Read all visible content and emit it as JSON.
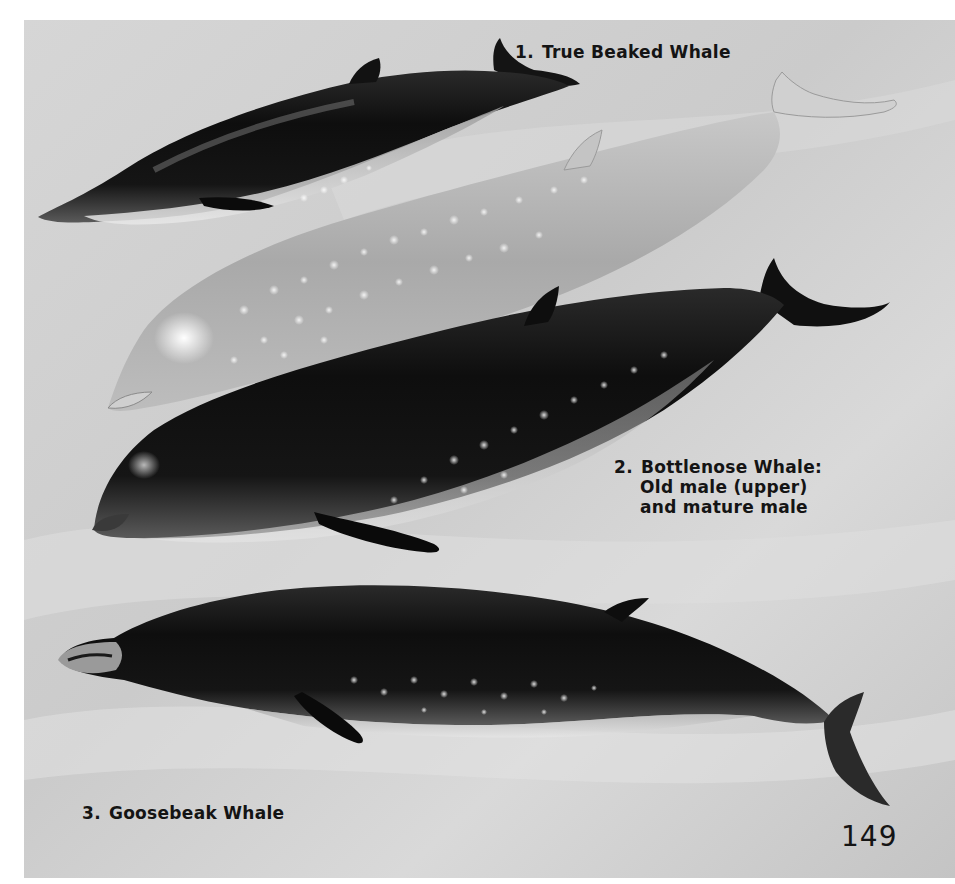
{
  "page": {
    "page_number": "149",
    "background_color": "#cfcfcf",
    "ink_color": "#141414"
  },
  "figures": [
    {
      "id": 1,
      "number": "1.",
      "label": "True Beaked Whale",
      "lines": [
        "True Beaked Whale"
      ]
    },
    {
      "id": 2,
      "number": "2.",
      "label": "Bottlenose Whale: Old male (upper) and mature male",
      "lines": [
        "Bottlenose Whale:",
        "Old male (upper)",
        "and mature male"
      ]
    },
    {
      "id": 3,
      "number": "3.",
      "label": "Goosebeak Whale",
      "lines": [
        "Goosebeak Whale"
      ]
    }
  ],
  "illustrations": [
    {
      "name": "true-beaked-whale",
      "tone": "dark",
      "figure": 1
    },
    {
      "name": "bottlenose-whale-old-male",
      "tone": "light",
      "figure": 2
    },
    {
      "name": "bottlenose-whale-mature-male",
      "tone": "dark",
      "figure": 2
    },
    {
      "name": "goosebeak-whale",
      "tone": "dark",
      "figure": 3
    }
  ]
}
